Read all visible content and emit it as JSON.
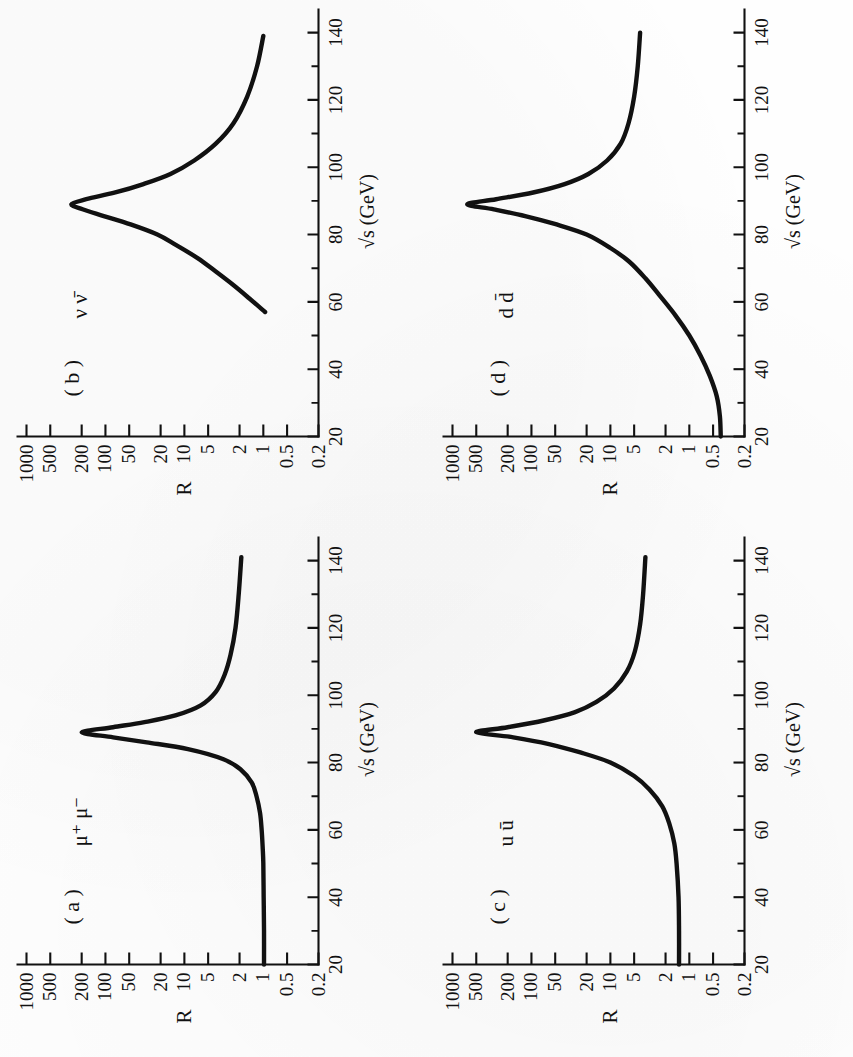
{
  "figure": {
    "orientation": "rotated-90-ccw",
    "panel_count": 4,
    "ink_color": "#111111",
    "paper_color": "#fefefe"
  },
  "axes": {
    "x": {
      "label": "√s  (GeV)",
      "label_plain": "sqrt(s) (GeV)",
      "unit": "GeV",
      "min": 20,
      "max": 143,
      "major_ticks": [
        20,
        40,
        60,
        80,
        100,
        120,
        140
      ],
      "major_tick_labels": [
        "20",
        "40",
        "60",
        "80",
        "100",
        "120",
        "140"
      ],
      "minor_ticks": [
        30,
        50,
        70,
        90,
        110,
        130
      ],
      "scale": "linear"
    },
    "y": {
      "label": "R",
      "min": 0.2,
      "max": 1000,
      "scale": "log",
      "major_ticks": [
        0.2,
        0.5,
        1,
        2,
        5,
        10,
        20,
        50,
        100,
        200,
        500,
        1000
      ],
      "major_tick_labels": [
        "0.2",
        "0.5",
        "1",
        "2",
        "5",
        "10",
        "20",
        "50",
        "100",
        "200",
        "500",
        "1000"
      ]
    }
  },
  "chart_data": {
    "type": "line",
    "title": "",
    "xlabel": "√s  (GeV)",
    "ylabel": "R",
    "xlim": [
      20,
      143
    ],
    "ylim": [
      0.2,
      1000
    ],
    "yscale": "log",
    "xscale": "linear",
    "grid": false,
    "legend": "none",
    "panels": [
      {
        "id": "a",
        "letter": "( a )",
        "process": "μ⁺ μ⁻",
        "process_plain": "mu+ mu-",
        "baseline_R": 1.0,
        "peak_x": 89,
        "peak_R": 200,
        "x_start": 20,
        "x_end": 141,
        "r_at_end": 1.9,
        "x": [
          20,
          30,
          40,
          50,
          55,
          60,
          65,
          70,
          74,
          78,
          81,
          84,
          86,
          87.5,
          89,
          90.5,
          92,
          94,
          97,
          101,
          106,
          112,
          120,
          130,
          141
        ],
        "y": [
          0.98,
          0.98,
          0.99,
          1.0,
          1.02,
          1.05,
          1.1,
          1.22,
          1.4,
          1.95,
          3.2,
          9.0,
          30,
          80,
          200,
          80,
          32,
          13,
          6.2,
          4.0,
          3.1,
          2.6,
          2.25,
          2.05,
          1.9
        ]
      },
      {
        "id": "b",
        "letter": "( b )",
        "process": "ν ν̄",
        "process_plain": "nu nubar",
        "baseline_R": null,
        "peak_x": 89,
        "peak_R": 270,
        "x_start": 57,
        "x_end": 139,
        "r_at_start": 0.95,
        "r_at_end": 1.0,
        "x": [
          57,
          61,
          65,
          69,
          73,
          77,
          80,
          83,
          85.5,
          87.5,
          89,
          90.5,
          92.5,
          95,
          98,
          102,
          107,
          113,
          121,
          130,
          139
        ],
        "y": [
          0.95,
          1.5,
          2.4,
          4.0,
          6.8,
          13,
          22,
          48,
          105,
          195,
          270,
          175,
          75,
          33,
          15,
          7.5,
          4.0,
          2.4,
          1.6,
          1.2,
          1.0
        ]
      },
      {
        "id": "c",
        "letter": "( c )",
        "process": "u ū",
        "process_plain": "u ubar",
        "baseline_R": 1.35,
        "peak_x": 89,
        "peak_R": 500,
        "x_start": 20,
        "x_end": 141,
        "r_at_end": 3.6,
        "x": [
          20,
          30,
          40,
          50,
          56,
          62,
          67,
          72,
          76,
          80,
          83,
          85.5,
          87.5,
          89,
          90.5,
          92.5,
          95,
          98,
          102,
          107,
          113,
          121,
          130,
          141
        ],
        "y": [
          1.35,
          1.35,
          1.37,
          1.45,
          1.55,
          1.8,
          2.2,
          3.2,
          5.0,
          10,
          24,
          60,
          170,
          500,
          200,
          70,
          28,
          15,
          9.0,
          6.2,
          4.9,
          4.2,
          3.85,
          3.6
        ]
      },
      {
        "id": "d",
        "letter": "( d )",
        "process": "d d̄",
        "process_plain": "d dbar",
        "baseline_R": 0.4,
        "peak_x": 89,
        "peak_R": 650,
        "x_start": 20,
        "x_end": 140,
        "r_at_end": 4.2,
        "x": [
          20,
          26,
          32,
          38,
          44,
          50,
          56,
          62,
          67,
          72,
          76,
          80,
          83,
          85.5,
          87.5,
          89,
          90.5,
          92.5,
          95,
          98,
          102,
          107,
          113,
          121,
          130,
          140
        ],
        "y": [
          0.4,
          0.41,
          0.45,
          0.55,
          0.72,
          1.0,
          1.5,
          2.4,
          3.6,
          5.8,
          10,
          20,
          48,
          120,
          300,
          650,
          280,
          95,
          38,
          19,
          11,
          7.4,
          5.9,
          5.0,
          4.5,
          4.2
        ]
      }
    ]
  },
  "panel_layout": [
    {
      "id": "b",
      "quadrant": "top-left"
    },
    {
      "id": "d",
      "quadrant": "top-right"
    },
    {
      "id": "a",
      "quadrant": "bottom-left"
    },
    {
      "id": "c",
      "quadrant": "bottom-right"
    }
  ]
}
